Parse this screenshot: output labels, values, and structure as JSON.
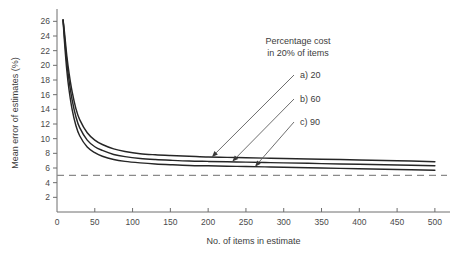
{
  "chart_data": {
    "type": "line",
    "title": "",
    "xlabel": "No. of items in estimate",
    "ylabel": "Mean error of estimates (%)",
    "xlim": [
      0,
      520
    ],
    "ylim": [
      0,
      27
    ],
    "xticks": [
      0,
      50,
      100,
      150,
      200,
      250,
      300,
      350,
      400,
      450,
      500
    ],
    "yticks": [
      2,
      4,
      6,
      8,
      10,
      12,
      14,
      16,
      18,
      20,
      22,
      24,
      26
    ],
    "grid": false,
    "legend_position": "upper-right-inside",
    "annotation": {
      "line1": "Percentage cost",
      "line2": "in 20% of items"
    },
    "reference_line": {
      "value": 5,
      "style": "dashed",
      "color": "#8a8a8a"
    },
    "series": [
      {
        "name": "a) 20",
        "label": "a) 20",
        "key": "a",
        "percentage_cost": 20,
        "color": "#262626",
        "x": [
          8,
          10,
          13,
          16,
          20,
          25,
          30,
          40,
          50,
          60,
          75,
          90,
          110,
          130,
          150,
          175,
          200,
          225,
          250,
          275,
          300,
          350,
          400,
          450,
          500
        ],
        "y": [
          26.2,
          24.4,
          21.3,
          18.9,
          16.4,
          14.1,
          12.6,
          10.8,
          9.8,
          9.2,
          8.6,
          8.25,
          7.95,
          7.8,
          7.7,
          7.6,
          7.5,
          7.45,
          7.4,
          7.35,
          7.3,
          7.2,
          7.1,
          7.0,
          6.85
        ]
      },
      {
        "name": "b) 60",
        "label": "b) 60",
        "key": "b",
        "percentage_cost": 60,
        "color": "#262626",
        "x": [
          8,
          10,
          13,
          16,
          20,
          25,
          30,
          40,
          50,
          60,
          75,
          90,
          110,
          130,
          150,
          175,
          200,
          225,
          250,
          275,
          300,
          350,
          400,
          450,
          500
        ],
        "y": [
          26.2,
          23.8,
          20.4,
          17.9,
          15.3,
          13.0,
          11.5,
          9.8,
          8.9,
          8.4,
          7.85,
          7.55,
          7.3,
          7.15,
          7.05,
          6.95,
          6.9,
          6.85,
          6.8,
          6.75,
          6.7,
          6.6,
          6.5,
          6.4,
          6.3
        ]
      },
      {
        "name": "c) 90",
        "label": "c) 90",
        "key": "c",
        "percentage_cost": 90,
        "color": "#262626",
        "x": [
          8,
          10,
          13,
          16,
          20,
          25,
          30,
          40,
          50,
          60,
          75,
          90,
          110,
          130,
          150,
          175,
          200,
          225,
          250,
          275,
          300,
          350,
          400,
          450,
          500
        ],
        "y": [
          26.2,
          23.1,
          19.3,
          16.6,
          14.0,
          11.8,
          10.4,
          8.85,
          8.1,
          7.6,
          7.15,
          6.9,
          6.7,
          6.55,
          6.45,
          6.35,
          6.3,
          6.25,
          6.2,
          6.15,
          6.1,
          6.0,
          5.9,
          5.8,
          5.7
        ]
      }
    ],
    "arrow_targets": [
      {
        "series": "a",
        "x": 205,
        "y": 7.5
      },
      {
        "series": "b",
        "x": 232,
        "y": 6.88
      },
      {
        "series": "c",
        "x": 262,
        "y": 6.18
      }
    ]
  }
}
